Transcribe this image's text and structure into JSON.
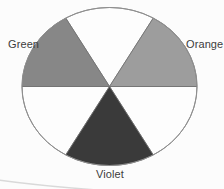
{
  "figure": {
    "name": "six-segment-color-wheel",
    "background": "#fcfcfc",
    "outline_color": "#8f8f8f",
    "divider_color": "#6f6f6f",
    "label_color": "#3d3d3d",
    "labels": {
      "green": "Green",
      "orange": "Orange",
      "violet": "Violet"
    },
    "segments": [
      {
        "name": "top-white",
        "start_deg": 60,
        "end_deg": 120,
        "fill": "#fdfdfd"
      },
      {
        "name": "bottom-left-white",
        "start_deg": 180,
        "end_deg": 240,
        "fill": "#fdfdfd"
      },
      {
        "name": "bottom-right-white",
        "start_deg": 300,
        "end_deg": 360,
        "fill": "#fdfdfd"
      },
      {
        "name": "green",
        "start_deg": 120,
        "end_deg": 180,
        "fill": "#878787"
      },
      {
        "name": "orange",
        "start_deg": 0,
        "end_deg": 60,
        "fill": "#9d9d9d"
      },
      {
        "name": "violet",
        "start_deg": 240,
        "end_deg": 300,
        "fill": "#3a3a3a"
      }
    ]
  }
}
